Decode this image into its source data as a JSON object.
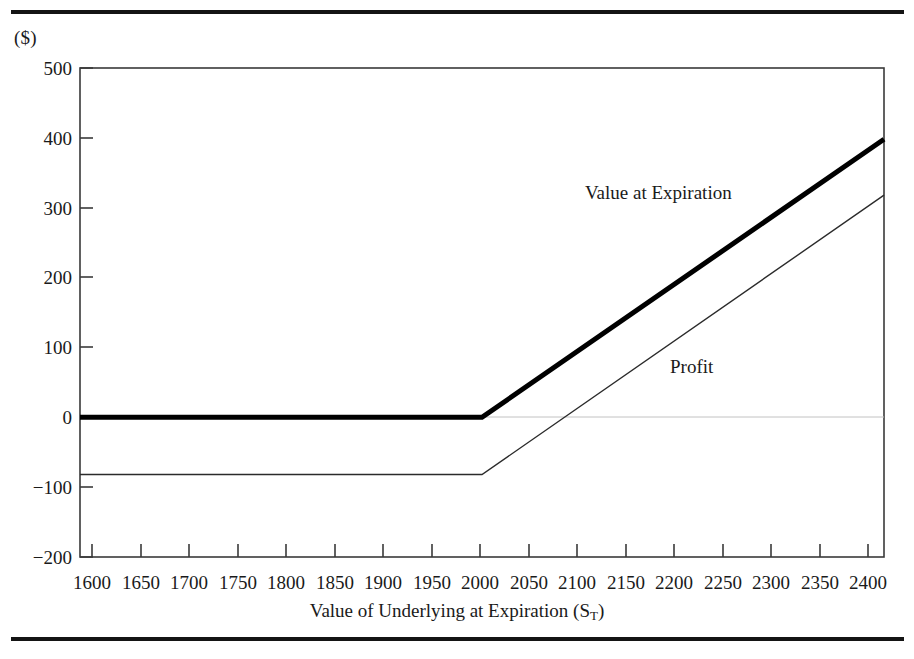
{
  "figure": {
    "units_label": "($)",
    "xaxis_title_pre": "Value of Underlying at Expiration (S",
    "xaxis_title_sub": "T",
    "xaxis_title_post": ")"
  },
  "chart_data": {
    "type": "line",
    "title": "",
    "subtitle": "",
    "xlabel": "Value of Underlying at Expiration (S_T)",
    "ylabel": "($)",
    "xlim": [
      1600,
      2400
    ],
    "ylim": [
      -200,
      500
    ],
    "xticks": [
      1600,
      1650,
      1700,
      1750,
      1800,
      1850,
      1900,
      1950,
      2000,
      2050,
      2100,
      2150,
      2200,
      2250,
      2300,
      2350,
      2400
    ],
    "yticks": [
      -200,
      -100,
      0,
      100,
      200,
      300,
      400,
      500
    ],
    "xtick_labels": [
      "1600",
      "1650",
      "1700",
      "1750",
      "1800",
      "1850",
      "1900",
      "1950",
      "2000",
      "2050",
      "2100",
      "2150",
      "2200",
      "2250",
      "2300",
      "2350",
      "2400"
    ],
    "ytick_labels": [
      "-200",
      "-100",
      "0",
      "100",
      "200",
      "300",
      "400",
      "500"
    ],
    "grid": false,
    "legend_position": "inline-annotation",
    "strike": 2000,
    "premium": 82,
    "series": [
      {
        "name": "Value at Expiration",
        "style": "thick",
        "color": "#000000",
        "linewidth": 5,
        "x": [
          1600,
          2000,
          2400
        ],
        "values": [
          0,
          0,
          398
        ],
        "annotation": {
          "text": "Value at Expiration",
          "x": 2130,
          "y": 318
        }
      },
      {
        "name": "Profit",
        "style": "thin",
        "color": "#2b2b2b",
        "linewidth": 1.4,
        "x": [
          1600,
          2000,
          2400
        ],
        "values": [
          -82,
          -82,
          318
        ],
        "annotation": {
          "text": "Profit",
          "x": 2205,
          "y": 75
        }
      }
    ],
    "zero_line": {
      "value": 0,
      "color": "#b9b9b9"
    }
  },
  "axis": {
    "ytick_labels": [
      "500",
      "400",
      "300",
      "200",
      "100",
      "0",
      "−100",
      "−200"
    ],
    "xtick_labels": [
      "1600",
      "1650",
      "1700",
      "1750",
      "1800",
      "1850",
      "1900",
      "1950",
      "2000",
      "2050",
      "2100",
      "2150",
      "2200",
      "2250",
      "2300",
      "2350",
      "2400"
    ]
  },
  "annotations": {
    "value_at_expiration": "Value at Expiration",
    "profit": "Profit"
  }
}
